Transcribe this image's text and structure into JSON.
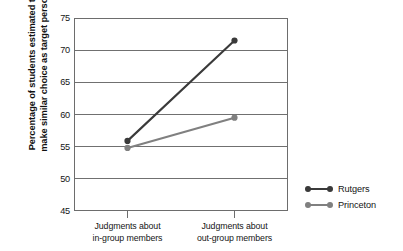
{
  "chart_data": {
    "type": "line",
    "title": "",
    "xlabel": "",
    "ylabel": "Percentage of students estimated to make similar choice as target person",
    "ylabel_lines": [
      "Percentage of students estimated to",
      "make similar choice as target person"
    ],
    "categories": [
      "Judgments about in-group members",
      "Judgments about out-group members"
    ],
    "category_lines": [
      [
        "Judgments about",
        "in-group members"
      ],
      [
        "Judgments about",
        "out-group members"
      ]
    ],
    "series": [
      {
        "name": "Rutgers",
        "values": [
          55.9,
          71.5
        ],
        "color": "#3a3a3a"
      },
      {
        "name": "Princeton",
        "values": [
          54.8,
          59.5
        ],
        "color": "#808080"
      }
    ],
    "ylim": [
      45,
      75
    ],
    "yticks": [
      45,
      50,
      55,
      60,
      65,
      70,
      75
    ],
    "ytick_labels": [
      "45",
      "50",
      "55",
      "60",
      "65",
      "70",
      "75"
    ],
    "gridlines": [
      50,
      55,
      60,
      65,
      70
    ],
    "grid": true,
    "legend_position": "right",
    "legend_entries": [
      "Rutgers",
      "Princeton"
    ],
    "axis_color": "#6d6d6d",
    "grid_color": "#707070",
    "background": "#ffffff"
  }
}
